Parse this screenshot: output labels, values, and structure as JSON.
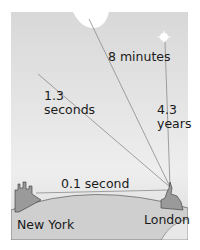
{
  "labels": {
    "sun": "8 minutes",
    "moon_line1": "1.3",
    "moon_line2": "seconds",
    "star_line1": "4.3",
    "star_line2": "years",
    "ground": "0.1 second",
    "new_york": "New York",
    "london": "London"
  },
  "colors": {
    "background": "#e4e4e4",
    "line": "#888888",
    "ground": "#c8c8c8",
    "text": "#1a1a1a"
  }
}
